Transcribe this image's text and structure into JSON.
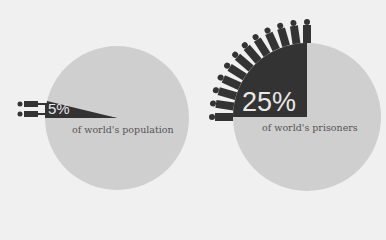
{
  "chart_data": {
    "type": "pie",
    "title": "",
    "charts": [
      {
        "label": "of world's population",
        "value": 5,
        "value_label": "5%",
        "highlight_color": "#333333",
        "base_color": "#cfcfcf"
      },
      {
        "label": "of world's prisoners",
        "value": 25,
        "value_label": "25%",
        "highlight_color": "#333333",
        "base_color": "#cfcfcf"
      }
    ],
    "icons": "person-figures radiating from highlighted wedge"
  },
  "left": {
    "percent": "5%",
    "caption": "of world's population"
  },
  "right": {
    "percent": "25%",
    "caption": "of world's prisoners"
  }
}
